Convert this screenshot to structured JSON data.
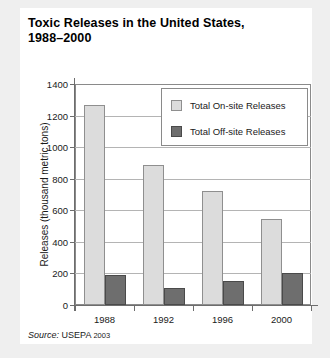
{
  "chart_data": {
    "type": "bar",
    "title": "Toxic Releases in the United States, 1988–2000",
    "title_line1": "Toxic Releases in the United States,",
    "title_line2": "1988–2000",
    "xlabel": "",
    "ylabel": "Releases (thousand metric tons)",
    "categories": [
      "1988",
      "1992",
      "1996",
      "2000"
    ],
    "ylim": [
      0,
      1400
    ],
    "yticks": [
      0,
      200,
      400,
      600,
      800,
      1000,
      1200,
      1400
    ],
    "ytick_labels": [
      "0",
      "200",
      "400",
      "600",
      "800",
      "1000",
      "1200",
      "1400"
    ],
    "grid": true,
    "legend_position": "top-right-inside",
    "series": [
      {
        "name": "Total On-site Releases",
        "color": "#dcdcdc",
        "values": [
          1265,
          885,
          720,
          545
        ]
      },
      {
        "name": "Total Off-site Releases",
        "color": "#6e6e6e",
        "values": [
          190,
          105,
          150,
          205
        ]
      }
    ],
    "source_label": "Source:",
    "source_agency": "USEPA",
    "source_year": "2003"
  },
  "figure": {
    "background": "#ffffff",
    "page_background": "#efefef",
    "frame_color": "#8a8a8a"
  }
}
